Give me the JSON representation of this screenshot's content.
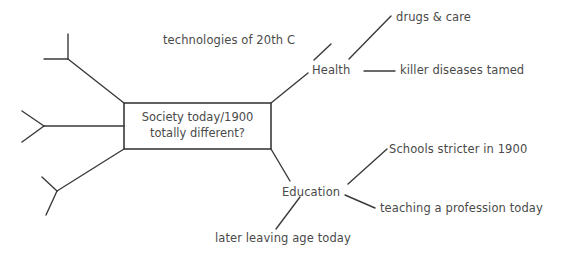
{
  "diagram": {
    "type": "mind-map",
    "background_color": "#ffffff",
    "line_color": "#3a3a3a",
    "text_color": "#4a4a4a",
    "center": {
      "line1": "Society today/1900",
      "line2": "totally different?"
    },
    "branches": [
      {
        "id": "health",
        "label": "Health",
        "sub_labels": [
          "technologies of 20th C",
          "drugs & care",
          "killer diseases tamed"
        ]
      },
      {
        "id": "education",
        "label": "Education",
        "sub_labels": [
          "Schools stricter in 1900",
          "teaching a profession today",
          "later leaving age today"
        ]
      }
    ],
    "empty_branches": [
      {
        "id": "empty-top-left"
      },
      {
        "id": "empty-middle-left"
      },
      {
        "id": "empty-bottom-left"
      }
    ],
    "labels": {
      "technologies": "technologies of 20th C",
      "health": "Health",
      "drugs_care": "drugs & care",
      "killer_diseases": "killer diseases tamed",
      "education": "Education",
      "schools_stricter": "Schools stricter in 1900",
      "teaching_profession": "teaching a profession today",
      "later_leaving_age": "later leaving age today"
    }
  }
}
